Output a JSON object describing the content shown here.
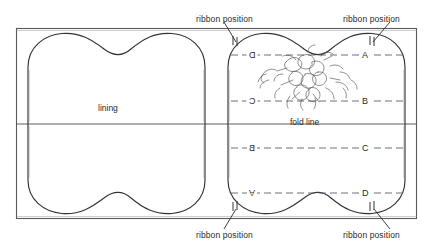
{
  "diagram": {
    "colors": {
      "ink": "#2a2a2a",
      "outline": "#333333",
      "frame": "#555555",
      "dashed_guide": "#5a5a6a",
      "motif": "#4a4a4a",
      "background": "#ffffff"
    },
    "panels": {
      "left": {
        "label": "lining"
      },
      "right": {
        "fold_line_label": "fold line",
        "guide_rows": [
          {
            "left_letter": "D",
            "left_mirrored": "horizontal",
            "right_letter": "A",
            "right_mirrored": "none"
          },
          {
            "left_letter": "C",
            "left_mirrored": "horizontal",
            "right_letter": "B",
            "right_mirrored": "none"
          },
          {
            "left_letter": "B",
            "left_mirrored": "horizontal",
            "right_letter": "C",
            "right_mirrored": "none"
          },
          {
            "left_letter": "A",
            "left_mirrored": "vertical",
            "right_letter": "D",
            "right_mirrored": "none"
          }
        ]
      }
    },
    "callouts": [
      {
        "id": "top-left",
        "text": "ribbon position"
      },
      {
        "id": "top-right",
        "text": "ribbon position"
      },
      {
        "id": "bottom-left",
        "text": "ribbon position"
      },
      {
        "id": "bottom-right",
        "text": "ribbon position"
      }
    ]
  }
}
